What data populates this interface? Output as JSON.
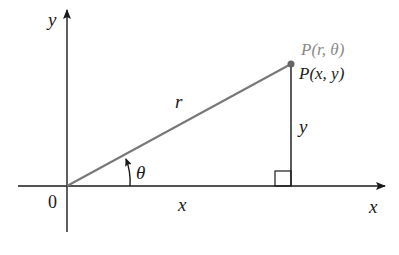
{
  "diagram": {
    "axes": {
      "x_label": "x",
      "y_label": "y",
      "origin_label": "0"
    },
    "point": {
      "polar_label": "P(r, θ)",
      "cartesian_label": "P(x, y)"
    },
    "segments": {
      "radius_label": "r",
      "horizontal_label": "x",
      "vertical_label": "y"
    },
    "angle_label": "θ",
    "colors": {
      "axis": "#1a1a1a",
      "radius_line": "#777777",
      "vertical_line": "#333333",
      "polar_label": "#8a8a8a",
      "cartesian_label": "#222222",
      "point": "#666666"
    }
  }
}
